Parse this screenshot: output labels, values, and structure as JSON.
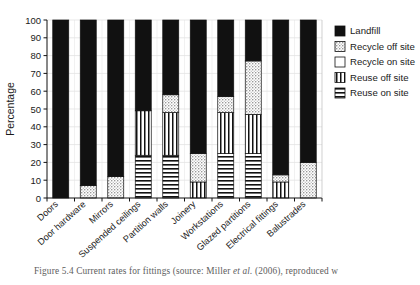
{
  "figure": {
    "caption_prefix": "Figure 5.4",
    "caption_text": "Current rates for fittings (source: Miller ",
    "caption_italic": "et al.",
    "caption_suffix": " (2006), reproduced w"
  },
  "axes": {
    "ylabel": "Percentage",
    "yticks": [
      0,
      10,
      20,
      30,
      40,
      50,
      60,
      70,
      80,
      90,
      100
    ],
    "ylim": [
      0,
      100
    ],
    "grid": true,
    "legend_position": "right"
  },
  "legend": {
    "items": [
      {
        "label": "Landfill",
        "pattern": "solid-black",
        "color": "#111111"
      },
      {
        "label": "Recycle off site",
        "pattern": "dots",
        "color": "#cccccc"
      },
      {
        "label": "Recycle on site",
        "pattern": "empty",
        "color": "#ffffff"
      },
      {
        "label": "Reuse off site",
        "pattern": "vertical-lines",
        "color": "#ffffff"
      },
      {
        "label": "Reuse on site",
        "pattern": "horizontal-lines",
        "color": "#ffffff"
      }
    ]
  },
  "chart_data": {
    "type": "bar",
    "stacked": true,
    "title": "",
    "xlabel": "",
    "ylabel": "Percentage",
    "ylim": [
      0,
      100
    ],
    "grid": true,
    "categories": [
      "Doors",
      "Door hardware",
      "Mirrors",
      "Suspended ceilings",
      "Partition walls",
      "Joinery",
      "Workstations",
      "Glazed partitions",
      "Electrical fittings",
      "Balustrades"
    ],
    "series": [
      {
        "name": "Reuse on site",
        "pattern": "horizontal-lines",
        "values": [
          0,
          0,
          0,
          24,
          24,
          0,
          25,
          25,
          0,
          0
        ]
      },
      {
        "name": "Reuse off site",
        "pattern": "vertical-lines",
        "values": [
          0,
          0,
          0,
          25,
          24,
          9,
          23,
          22,
          9,
          0
        ]
      },
      {
        "name": "Recycle on site",
        "pattern": "empty",
        "values": [
          0,
          0,
          0,
          0,
          0,
          0,
          0,
          0,
          0,
          0
        ]
      },
      {
        "name": "Recycle off site",
        "pattern": "dots",
        "values": [
          0,
          7,
          12,
          0,
          10,
          16,
          9,
          30,
          4,
          20
        ]
      },
      {
        "name": "Landfill",
        "pattern": "solid-black",
        "values": [
          100,
          93,
          88,
          51,
          42,
          75,
          43,
          23,
          87,
          80
        ]
      }
    ]
  }
}
